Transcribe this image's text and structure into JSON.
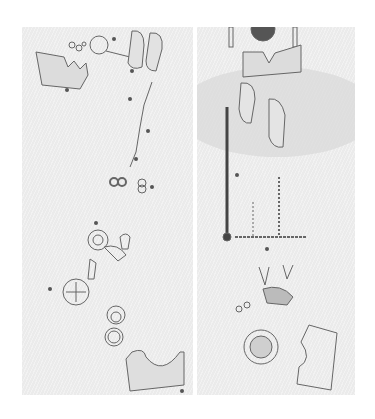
{
  "figure": {
    "panels": [
      {
        "id": "left",
        "description": "Drawing of grave goods layout, scattered artifacts (plaques, shoes, rings, mirror, bowls)"
      },
      {
        "id": "right",
        "description": "Drawing of grave goods layout with faint background imagery, sword, shoes, beads, mirror, plaque"
      }
    ],
    "colors": {
      "background": "#ffffff",
      "panel": "#ebebeb",
      "ink": "#555555"
    }
  }
}
